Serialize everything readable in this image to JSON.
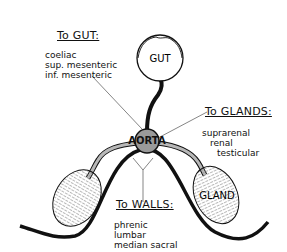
{
  "diagram": {
    "gut": {
      "label": "GUT"
    },
    "aorta": {
      "label": "AORTA"
    },
    "gland": {
      "label": "GLAND"
    },
    "groups": [
      {
        "heading": "To GUT:",
        "items": [
          "coeliac",
          "sup. mesenteric",
          "inf. mesenteric"
        ]
      },
      {
        "heading": "To GLANDS:",
        "items": [
          "suprarenal",
          "renal",
          "testicular"
        ]
      },
      {
        "heading": "To WALLS:",
        "items": [
          "phrenic",
          "lumbar",
          "median sacral"
        ]
      }
    ]
  },
  "colors": {
    "line": "#111111",
    "vessel": "#b8b8b8",
    "aorta_fill": "#9a9a9a",
    "background": "#ffffff"
  }
}
